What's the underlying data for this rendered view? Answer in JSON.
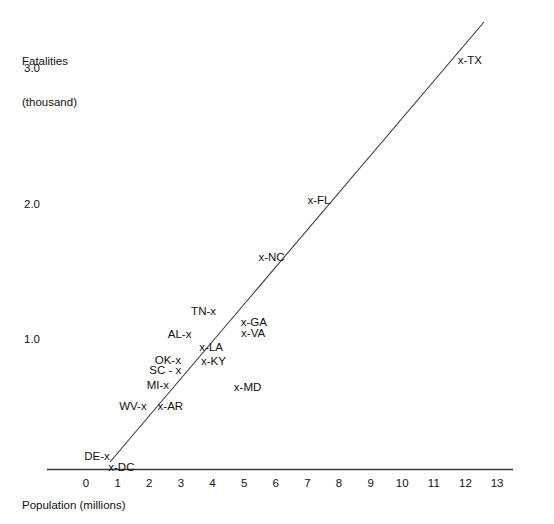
{
  "chart_data": {
    "type": "scatter",
    "title": "",
    "xlabel": "Population (millions)",
    "ylabel": "Fatalities\n(thousand)",
    "ylabel_line1": "Fatalities",
    "ylabel_line2": "(thousand)",
    "xlim": [
      0,
      13
    ],
    "ylim": [
      0,
      3.0
    ],
    "grid": false,
    "legend": null,
    "xticks": [
      "0",
      "1",
      "2",
      "3",
      "4",
      "5",
      "6",
      "7",
      "8",
      "9",
      "10",
      "11",
      "12",
      "13"
    ],
    "xtick_values": [
      0,
      1,
      2,
      3,
      4,
      5,
      6,
      7,
      8,
      9,
      10,
      11,
      12,
      13
    ],
    "yticks": [
      "1.0",
      "2.0",
      "3.0"
    ],
    "ytick_values": [
      1.0,
      2.0,
      3.0
    ],
    "point_marker": "x",
    "annotations": [
      {
        "label": "DE-x",
        "text": "DE-x",
        "state": "DE",
        "marker_side": "right",
        "x": 0.67,
        "y": 0.13
      },
      {
        "label": "x-DC",
        "text": "x-DC",
        "state": "DC",
        "marker_side": "left",
        "x": 0.8,
        "y": 0.05
      },
      {
        "label": "WV-x",
        "text": "WV-x",
        "state": "WV",
        "marker_side": "right",
        "x": 1.81,
        "y": 0.5
      },
      {
        "label": "x-AR",
        "text": "x-AR",
        "state": "AR",
        "marker_side": "left",
        "x": 2.36,
        "y": 0.5
      },
      {
        "label": "MI-x",
        "text": "MI-x",
        "state": "MI",
        "marker_side": "right",
        "x": 2.52,
        "y": 0.65
      },
      {
        "label": "SC - x",
        "text": "SC - x",
        "state": "SC",
        "marker_side": "right",
        "x": 2.92,
        "y": 0.76
      },
      {
        "label": "OK-x",
        "text": "OK-x",
        "state": "OK",
        "marker_side": "right",
        "x": 2.9,
        "y": 0.84
      },
      {
        "label": "x-KY",
        "text": "x-KY",
        "state": "KY",
        "marker_side": "left",
        "x": 3.73,
        "y": 0.83
      },
      {
        "label": "x-LA",
        "text": "x-LA",
        "state": "LA",
        "marker_side": "left",
        "x": 3.68,
        "y": 0.93
      },
      {
        "label": "AL-x",
        "text": "AL-x",
        "state": "AL",
        "marker_side": "right",
        "x": 3.25,
        "y": 1.03
      },
      {
        "label": "x-MD",
        "text": "x-MD",
        "state": "MD",
        "marker_side": "left",
        "x": 4.77,
        "y": 0.64
      },
      {
        "label": "x-VA",
        "text": "x-VA",
        "state": "VA",
        "marker_side": "left",
        "x": 5.0,
        "y": 1.04
      },
      {
        "label": "x-GA",
        "text": "x-GA",
        "state": "GA",
        "marker_side": "left",
        "x": 4.99,
        "y": 1.12
      },
      {
        "label": "TN-x",
        "text": "TN-x",
        "state": "TN",
        "marker_side": "right",
        "x": 4.02,
        "y": 1.2
      },
      {
        "label": "x-NC",
        "text": "x-NC",
        "state": "NC",
        "marker_side": "left",
        "x": 5.55,
        "y": 1.6
      },
      {
        "label": "x-FL",
        "text": "x-FL",
        "state": "FL",
        "marker_side": "left",
        "x": 7.1,
        "y": 2.02
      },
      {
        "label": "x-TX",
        "text": "x-TX",
        "state": "TX",
        "marker_side": "left",
        "x": 11.85,
        "y": 3.05
      }
    ],
    "fit_line": {
      "label": "regression-line",
      "x_start": 0.76,
      "y_start": 0.05,
      "x_end": 11.85,
      "y_end": 3.06
    },
    "colors": {
      "axis": "#3a3a3a",
      "text": "#111111",
      "line": "#3a3a3a",
      "background": "#ffffff"
    }
  }
}
